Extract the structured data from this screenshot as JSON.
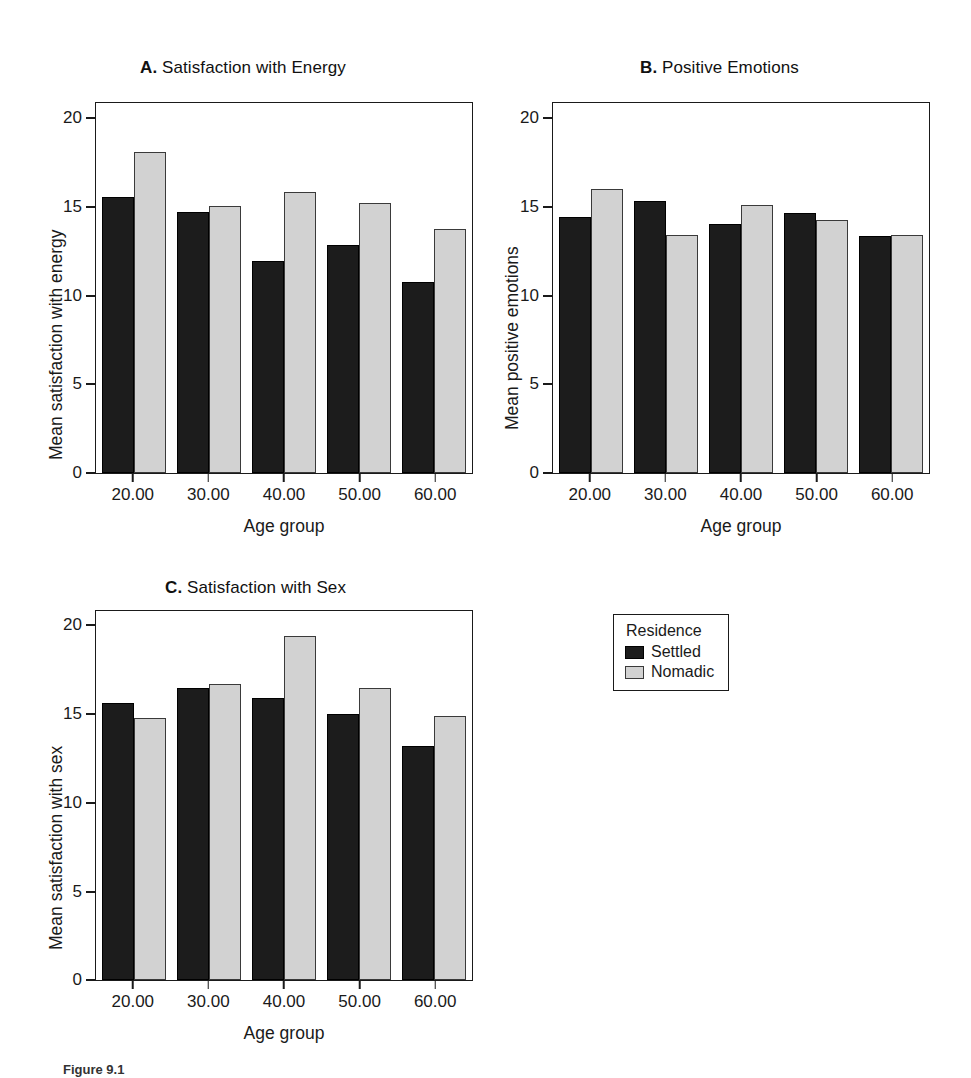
{
  "figure": {
    "caption": "Figure 9.1"
  },
  "legend": {
    "title": "Residence",
    "entries": [
      {
        "label": "Settled",
        "color": "#1c1c1c",
        "swatch": "settled-swatch"
      },
      {
        "label": "Nomadic",
        "color": "#d2d2d2",
        "swatch": "nomadic-swatch"
      }
    ]
  },
  "axis": {
    "yticks": [
      "0",
      "5",
      "10",
      "15",
      "20"
    ],
    "xticks": [
      "20.00",
      "30.00",
      "40.00",
      "50.00",
      "60.00"
    ],
    "xlabel": "Age group"
  },
  "panels": [
    {
      "letter": "A.",
      "name": "Satisfaction with Energy",
      "ylabel": "Mean satisfaction with energy"
    },
    {
      "letter": "B.",
      "name": "Positive Emotions",
      "ylabel": "Mean positive emotions"
    },
    {
      "letter": "C.",
      "name": "Satisfaction with Sex",
      "ylabel": "Mean satisfaction with sex"
    }
  ],
  "chart_data": [
    {
      "type": "bar",
      "title": "A. Satisfaction with Energy",
      "xlabel": "Age group",
      "ylabel": "Mean satisfaction with energy",
      "categories": [
        "20.00",
        "30.00",
        "40.00",
        "50.00",
        "60.00"
      ],
      "ylim": [
        0,
        21
      ],
      "yticks": [
        0,
        5,
        10,
        15,
        20
      ],
      "grid": false,
      "legend_position": "outside-right",
      "series": [
        {
          "name": "Settled",
          "color": "#1c1c1c",
          "values": [
            15.6,
            14.8,
            12.0,
            12.9,
            10.8
          ]
        },
        {
          "name": "Nomadic",
          "color": "#d2d2d2",
          "values": [
            18.2,
            15.1,
            15.9,
            15.3,
            13.8
          ]
        }
      ]
    },
    {
      "type": "bar",
      "title": "B. Positive Emotions",
      "xlabel": "Age group",
      "ylabel": "Mean positive emotions",
      "categories": [
        "20.00",
        "30.00",
        "40.00",
        "50.00",
        "60.00"
      ],
      "ylim": [
        0,
        21
      ],
      "yticks": [
        0,
        5,
        10,
        15,
        20
      ],
      "grid": false,
      "legend_position": "outside-right",
      "series": [
        {
          "name": "Settled",
          "color": "#1c1c1c",
          "values": [
            14.5,
            15.4,
            14.1,
            14.7,
            13.4
          ]
        },
        {
          "name": "Nomadic",
          "color": "#d2d2d2",
          "values": [
            16.1,
            13.5,
            15.2,
            14.3,
            13.5
          ]
        }
      ]
    },
    {
      "type": "bar",
      "title": "C. Satisfaction with Sex",
      "xlabel": "Age group",
      "ylabel": "Mean satisfaction with sex",
      "categories": [
        "20.00",
        "30.00",
        "40.00",
        "50.00",
        "60.00"
      ],
      "ylim": [
        0,
        21
      ],
      "yticks": [
        0,
        5,
        10,
        15,
        20
      ],
      "grid": false,
      "legend_position": "outside-right",
      "series": [
        {
          "name": "Settled",
          "color": "#1c1c1c",
          "values": [
            15.7,
            16.6,
            16.0,
            15.1,
            13.3
          ]
        },
        {
          "name": "Nomadic",
          "color": "#d2d2d2",
          "values": [
            14.9,
            16.8,
            19.5,
            16.6,
            15.0
          ]
        }
      ]
    }
  ]
}
